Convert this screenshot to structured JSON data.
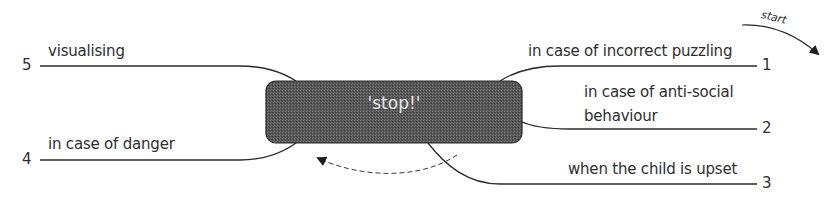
{
  "diagram": {
    "center": {
      "label": "'stop!'",
      "fill": "#555555",
      "text_color": "#e6e6e6"
    },
    "start_label": "start",
    "branches": [
      {
        "number": "1",
        "label": "in case of incorrect puzzling"
      },
      {
        "number": "2",
        "label_line1": "in case of anti-social",
        "label_line2": "behaviour"
      },
      {
        "number": "3",
        "label": "when the child is upset"
      },
      {
        "number": "4",
        "label": "in case of danger"
      },
      {
        "number": "5",
        "label": "visualising"
      }
    ],
    "line_color": "#2b2b2b"
  }
}
